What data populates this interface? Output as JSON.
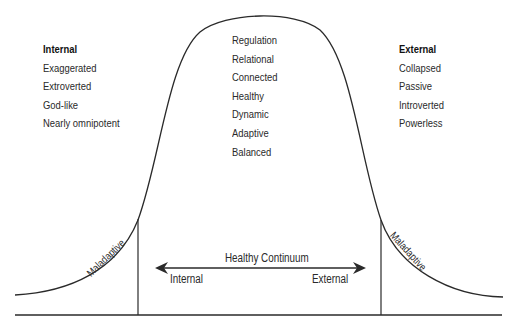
{
  "diagram": {
    "type": "bell-curve",
    "left_group": {
      "heading": "Internal",
      "items": [
        "Exaggerated",
        "Extroverted",
        "God-like",
        "Nearly omnipotent"
      ]
    },
    "center_group": {
      "items": [
        "Regulation",
        "Relational",
        "Connected",
        "Healthy",
        "Dynamic",
        "Adaptive",
        "Balanced"
      ]
    },
    "right_group": {
      "heading": "External",
      "items": [
        "Collapsed",
        "Passive",
        "Introverted",
        "Powerless"
      ]
    },
    "tails": {
      "left_label": "Maladaptive",
      "right_label": "Maladaptive"
    },
    "continuum": {
      "title": "Healthy Continuum",
      "left_end": "Internal",
      "right_end": "External"
    },
    "colors": {
      "line": "#2a2a2a",
      "text": "#2a2a2a",
      "background": "#ffffff"
    }
  }
}
